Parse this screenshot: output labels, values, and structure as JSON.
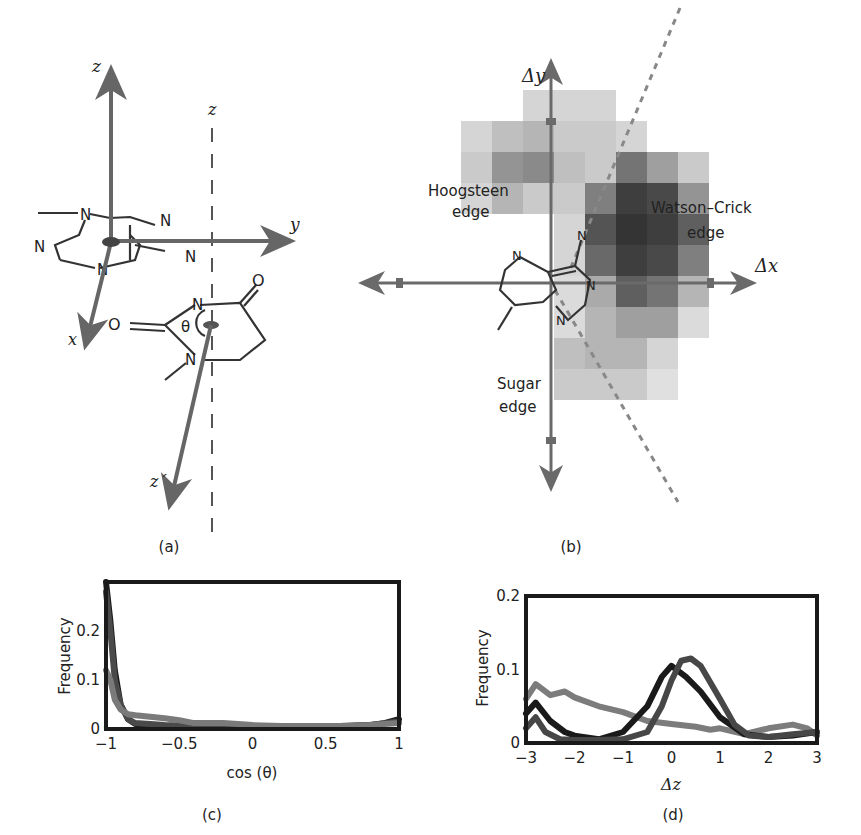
{
  "figure": {
    "panel_a": {
      "caption": "(a)",
      "axis_labels": {
        "z": "z",
        "z_dashed": "z",
        "y": "y",
        "x": "x",
        "z_prime": "z´"
      },
      "angle_label": "θ",
      "atom_labels": [
        "N",
        "N",
        "N",
        "N",
        "N",
        "N",
        "N",
        "O",
        "O"
      ]
    },
    "panel_b": {
      "caption": "(b)",
      "axis_labels": {
        "dy": "Δy",
        "dx": "Δx"
      },
      "region_labels": {
        "hoogsteen_1": "Hoogsteen",
        "hoogsteen_2": "edge",
        "watson_1": "Watson–Crick",
        "watson_2": "edge",
        "sugar_1": "Sugar",
        "sugar_2": "edge"
      },
      "atom_labels": [
        "N",
        "N",
        "N",
        "N"
      ]
    },
    "panel_c": {
      "caption": "(c)"
    },
    "panel_d": {
      "caption": "(d)"
    }
  },
  "chart_data": [
    {
      "id": "c",
      "type": "line",
      "title": "",
      "xlabel": "cos (θ)",
      "ylabel": "Frequency",
      "xlim": [
        -1,
        1
      ],
      "ylim": [
        0,
        0.3
      ],
      "xticks": [
        "−1",
        "−0.5",
        "0",
        "0.5",
        "1"
      ],
      "yticks": [
        "0",
        "0.1",
        "0.2"
      ],
      "grid": false,
      "legend": null,
      "series": [
        {
          "name": "series-1 (black)",
          "color": "#1c1c1c",
          "x": [
            -1,
            -0.97,
            -0.94,
            -0.9,
            -0.85,
            -0.8,
            -0.6,
            -0.4,
            -0.2,
            0,
            0.2,
            0.4,
            0.6,
            0.8,
            0.9,
            1
          ],
          "y": [
            0.3,
            0.22,
            0.12,
            0.05,
            0.02,
            0.01,
            0.005,
            0.005,
            0.005,
            0.005,
            0.005,
            0.005,
            0.005,
            0.008,
            0.012,
            0.02
          ]
        },
        {
          "name": "series-2 (dark gray)",
          "color": "#4a4a4a",
          "x": [
            -1,
            -0.97,
            -0.94,
            -0.9,
            -0.85,
            -0.8,
            -0.6,
            -0.4,
            -0.2,
            0,
            0.2,
            0.4,
            0.6,
            0.8,
            1
          ],
          "y": [
            0.28,
            0.2,
            0.1,
            0.05,
            0.02,
            0.012,
            0.008,
            0.006,
            0.006,
            0.005,
            0.005,
            0.005,
            0.006,
            0.008,
            0.015
          ]
        },
        {
          "name": "series-3 (gray)",
          "color": "#7a7a7a",
          "x": [
            -1,
            -0.97,
            -0.94,
            -0.9,
            -0.85,
            -0.8,
            -0.7,
            -0.6,
            -0.5,
            -0.4,
            -0.2,
            0,
            0.2,
            0.4,
            0.6,
            0.8,
            1
          ],
          "y": [
            0.12,
            0.1,
            0.06,
            0.04,
            0.03,
            0.028,
            0.025,
            0.022,
            0.018,
            0.012,
            0.012,
            0.008,
            0.006,
            0.006,
            0.006,
            0.008,
            0.012
          ]
        }
      ]
    },
    {
      "id": "d",
      "type": "line",
      "title": "",
      "xlabel": "Δz",
      "ylabel": "Frequency",
      "xlim": [
        -3,
        3
      ],
      "ylim": [
        0,
        0.2
      ],
      "xticks": [
        "−3",
        "−2",
        "−1",
        "0",
        "1",
        "2",
        "3"
      ],
      "yticks": [
        "0",
        "0.1",
        "0.2"
      ],
      "grid": false,
      "legend": null,
      "series": [
        {
          "name": "series-1 (light gray)",
          "color": "#7c7c7c",
          "x": [
            -3,
            -2.8,
            -2.5,
            -2.2,
            -2,
            -1.5,
            -1,
            -0.5,
            0,
            0.5,
            0.8,
            1,
            1.5,
            2,
            2.5,
            2.8,
            3
          ],
          "y": [
            0.06,
            0.08,
            0.065,
            0.07,
            0.062,
            0.05,
            0.042,
            0.03,
            0.026,
            0.022,
            0.018,
            0.02,
            0.012,
            0.02,
            0.025,
            0.02,
            0.01
          ]
        },
        {
          "name": "series-2 (black)",
          "color": "#1a1a1a",
          "x": [
            -3,
            -2.8,
            -2.5,
            -2.2,
            -2,
            -1.5,
            -1,
            -0.5,
            -0.2,
            0,
            0.3,
            0.6,
            1,
            1.5,
            2,
            2.5,
            3
          ],
          "y": [
            0.04,
            0.055,
            0.03,
            0.015,
            0.01,
            0.005,
            0.015,
            0.05,
            0.09,
            0.105,
            0.09,
            0.07,
            0.035,
            0.012,
            0.008,
            0.01,
            0.015
          ]
        },
        {
          "name": "series-3 (dark gray)",
          "color": "#474747",
          "x": [
            -3,
            -2.8,
            -2.6,
            -2.3,
            -2,
            -1.5,
            -1,
            -0.5,
            -0.2,
            0,
            0.2,
            0.4,
            0.6,
            1,
            1.3,
            1.6,
            2,
            2.5,
            3
          ],
          "y": [
            0.02,
            0.035,
            0.015,
            0.005,
            0.004,
            0.004,
            0.005,
            0.015,
            0.05,
            0.085,
            0.112,
            0.115,
            0.105,
            0.06,
            0.025,
            0.01,
            0.008,
            0.012,
            0.015
          ]
        }
      ]
    },
    {
      "id": "b",
      "type": "heatmap",
      "title": "",
      "xlabel": "Δx",
      "ylabel": "Δy",
      "note": "Grayscale density (0=white, 1=black) on 8 columns x 11 rows grid, row 0 at top",
      "grid": [
        [
          0,
          0,
          0.15,
          0.15,
          0.15,
          0,
          0,
          0
        ],
        [
          0.15,
          0.25,
          0.3,
          0.2,
          0.2,
          0.15,
          0,
          0
        ],
        [
          0.2,
          0.45,
          0.5,
          0.25,
          0.2,
          0.6,
          0.4,
          0.2
        ],
        [
          0.15,
          0.3,
          0.2,
          0.2,
          0.55,
          0.85,
          0.8,
          0.45
        ],
        [
          0,
          0,
          0,
          0.15,
          0.75,
          0.9,
          0.85,
          0.7
        ],
        [
          0,
          0,
          0,
          0.15,
          0.65,
          0.85,
          0.8,
          0.55
        ],
        [
          0,
          0,
          0,
          0.12,
          0.35,
          0.7,
          0.6,
          0.3
        ],
        [
          0,
          0,
          0,
          0.12,
          0.3,
          0.4,
          0.4,
          0.12
        ],
        [
          0,
          0,
          0,
          0.25,
          0.3,
          0.3,
          0.15,
          0
        ],
        [
          0,
          0,
          0,
          0.2,
          0.2,
          0.2,
          0.1,
          0
        ],
        [
          0,
          0,
          0,
          0,
          0,
          0,
          0,
          0
        ]
      ]
    }
  ]
}
